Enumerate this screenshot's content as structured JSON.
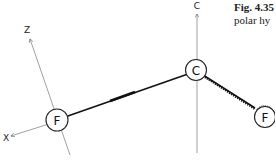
{
  "caption": {
    "figure_number": "Fig. 4.35",
    "text_fragment": "polar hy"
  },
  "axes": {
    "z_label": "Z",
    "x_label": "X",
    "c_label": "C"
  },
  "atoms": [
    {
      "id": "fluorine-left",
      "label": "F"
    },
    {
      "id": "carbon-center",
      "label": "C"
    },
    {
      "id": "fluorine-right",
      "label": "F"
    }
  ],
  "colors": {
    "bond": "#111111",
    "axis": "#777777",
    "atom_outline": "#222222"
  }
}
